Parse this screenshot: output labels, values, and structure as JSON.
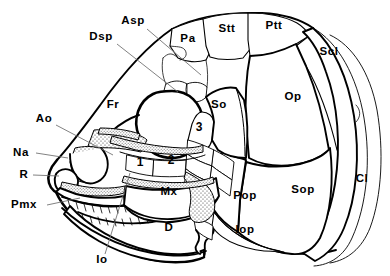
{
  "figure": {
    "type": "anatomical-line-diagram",
    "view": "lateral-left",
    "background_color": "#ffffff",
    "line_color": "#000000",
    "leader_line_color": "#6b6b6b",
    "stipple_fill_color": "#d9d9d9"
  },
  "labels": [
    {
      "id": "Asp",
      "text": "Asp",
      "x": 133,
      "y": 24,
      "align": "middle",
      "has_leader": true,
      "leader": [
        [
          147,
          29
        ],
        [
          201,
          75
        ]
      ]
    },
    {
      "id": "Dsp",
      "text": "Dsp",
      "x": 101,
      "y": 40,
      "align": "middle",
      "has_leader": true,
      "leader": [
        [
          117,
          44
        ],
        [
          178,
          92
        ]
      ]
    },
    {
      "id": "Pa",
      "text": "Pa",
      "x": 188,
      "y": 42,
      "align": "middle",
      "has_leader": false,
      "leader": []
    },
    {
      "id": "Stt",
      "text": "Stt",
      "x": 227,
      "y": 32,
      "align": "middle",
      "has_leader": false,
      "leader": []
    },
    {
      "id": "Ptt",
      "text": "Ptt",
      "x": 274,
      "y": 29,
      "align": "middle",
      "has_leader": false,
      "leader": []
    },
    {
      "id": "Scl",
      "text": "Scl",
      "x": 329,
      "y": 55,
      "align": "middle",
      "has_leader": false,
      "leader": []
    },
    {
      "id": "Fr",
      "text": "Fr",
      "x": 113,
      "y": 108,
      "align": "middle",
      "has_leader": false,
      "leader": []
    },
    {
      "id": "So",
      "text": "So",
      "x": 219,
      "y": 108,
      "align": "middle",
      "has_leader": false,
      "leader": []
    },
    {
      "id": "Op",
      "text": "Op",
      "x": 293,
      "y": 100,
      "align": "middle",
      "has_leader": false,
      "leader": []
    },
    {
      "id": "Ao",
      "text": "Ao",
      "x": 44,
      "y": 122,
      "align": "middle",
      "has_leader": true,
      "leader": [
        [
          56,
          125
        ],
        [
          113,
          155
        ]
      ]
    },
    {
      "id": "3",
      "text": "3",
      "x": 199,
      "y": 131,
      "align": "middle",
      "has_leader": false,
      "leader": [],
      "is_number": true
    },
    {
      "id": "Na",
      "text": "Na",
      "x": 21,
      "y": 156,
      "align": "middle",
      "has_leader": true,
      "leader": [
        [
          36,
          153
        ],
        [
          68,
          158
        ]
      ]
    },
    {
      "id": "R",
      "text": "R",
      "x": 24,
      "y": 178,
      "align": "middle",
      "has_leader": true,
      "leader": [
        [
          33,
          175
        ],
        [
          59,
          176
        ]
      ]
    },
    {
      "id": "1",
      "text": "1",
      "x": 140,
      "y": 166,
      "align": "middle",
      "has_leader": false,
      "leader": [],
      "is_number": true
    },
    {
      "id": "2",
      "text": "2",
      "x": 171,
      "y": 164,
      "align": "middle",
      "has_leader": false,
      "leader": [],
      "is_number": true
    },
    {
      "id": "Cl",
      "text": "Cl",
      "x": 362,
      "y": 182,
      "align": "middle",
      "has_leader": false,
      "leader": []
    },
    {
      "id": "Sop",
      "text": "Sop",
      "x": 303,
      "y": 193,
      "align": "middle",
      "has_leader": false,
      "leader": []
    },
    {
      "id": "Pop",
      "text": "Pop",
      "x": 245,
      "y": 199,
      "align": "middle",
      "has_leader": false,
      "leader": []
    },
    {
      "id": "Mx",
      "text": "Mx",
      "x": 169,
      "y": 195,
      "align": "middle",
      "has_leader": false,
      "leader": []
    },
    {
      "id": "Pmx",
      "text": "Pmx",
      "x": 24,
      "y": 208,
      "align": "middle",
      "has_leader": true,
      "leader": [
        [
          47,
          205
        ],
        [
          80,
          198
        ]
      ]
    },
    {
      "id": "D",
      "text": "D",
      "x": 169,
      "y": 231,
      "align": "middle",
      "has_leader": false,
      "leader": []
    },
    {
      "id": "Iop",
      "text": "Iop",
      "x": 245,
      "y": 233,
      "align": "middle",
      "has_leader": false,
      "leader": []
    },
    {
      "id": "Io",
      "text": "Io",
      "x": 102,
      "y": 263,
      "align": "middle",
      "has_leader": true,
      "leader": [
        [
          105,
          254
        ],
        [
          130,
          173
        ]
      ]
    }
  ],
  "legend_note": {
    "numbered_elements": "1, 2, 3 mark unlabelled infraorbital series elements"
  }
}
